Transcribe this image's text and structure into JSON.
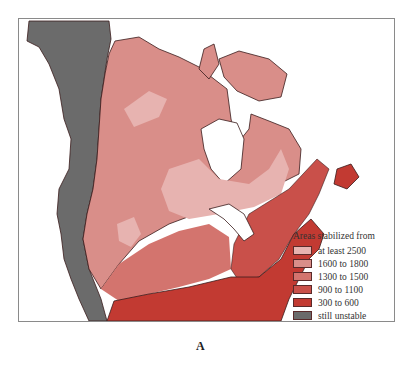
{
  "map": {
    "label": "A",
    "region": "North America",
    "legend": {
      "title": "Areas stabilized from",
      "unit": "Million years",
      "items": [
        {
          "label": "at least 2500",
          "color": "#e7b3b0"
        },
        {
          "label": "1600 to 1800",
          "color": "#d98e89"
        },
        {
          "label": "1300 to 1500",
          "color": "#d3746e"
        },
        {
          "label": "900 to 1100",
          "color": "#c9504a"
        },
        {
          "label": "300 to 600",
          "color": "#c23a32"
        },
        {
          "label": "still unstable",
          "color": "#6b6b6b"
        }
      ]
    },
    "colors": {
      "ocean": "#ffffff",
      "border": "#3a1c1c",
      "frame": "#8a8a8a"
    }
  }
}
